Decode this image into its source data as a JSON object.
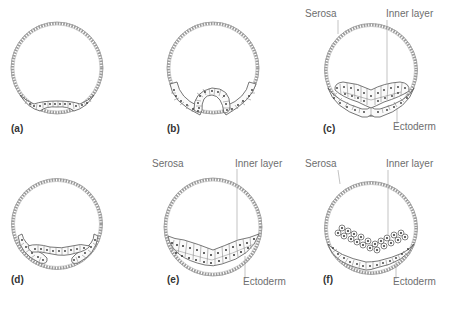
{
  "figure": {
    "panels": [
      {
        "id": "a",
        "label": "(a)",
        "annotations": []
      },
      {
        "id": "b",
        "label": "(b)",
        "annotations": []
      },
      {
        "id": "c",
        "label": "(c)",
        "annotations": [
          "Serosa",
          "Inner layer",
          "Ectoderm"
        ]
      },
      {
        "id": "d",
        "label": "(d)",
        "annotations": []
      },
      {
        "id": "e",
        "label": "(e)",
        "annotations": [
          "Serosa",
          "Inner layer",
          "Ectoderm"
        ]
      },
      {
        "id": "f",
        "label": "(f)",
        "annotations": [
          "Serosa",
          "Inner layer",
          "Ectoderm"
        ]
      }
    ]
  },
  "labels": {
    "serosa": "Serosa",
    "inner_layer": "Inner layer",
    "ectoderm": "Ectoderm"
  },
  "colors": {
    "background": "#ffffff",
    "outline": "#555555",
    "label_text": "#6e6e6e"
  }
}
